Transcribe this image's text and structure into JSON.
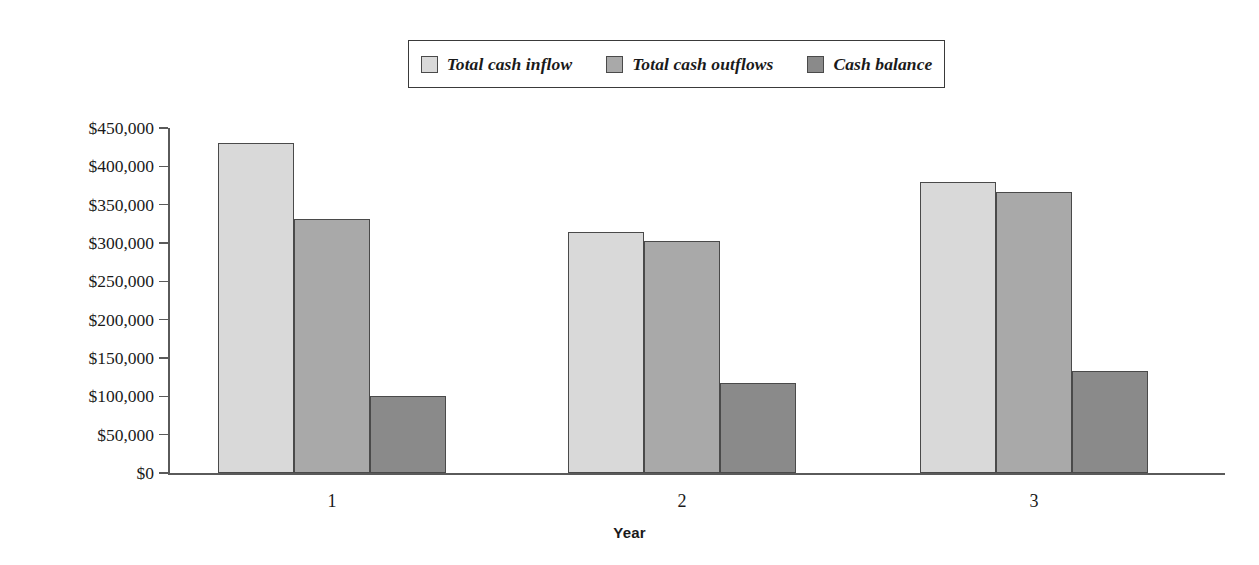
{
  "chart_data": {
    "type": "bar",
    "title": "",
    "subtitle": "",
    "xlabel": "Year",
    "ylabel": "",
    "categories": [
      "1",
      "2",
      "3"
    ],
    "series": [
      {
        "name": "Total cash inflow",
        "color": "#d9d9d9",
        "values": [
          430000,
          314000,
          380000
        ]
      },
      {
        "name": "Total cash outflows",
        "color": "#a9a9a9",
        "values": [
          331000,
          302000,
          366000
        ]
      },
      {
        "name": "Cash balance",
        "color": "#8a8a8a",
        "values": [
          101000,
          117000,
          133000
        ]
      }
    ],
    "ylim": [
      0,
      450000
    ],
    "ytick_values": [
      0,
      50000,
      100000,
      150000,
      200000,
      250000,
      300000,
      350000,
      400000,
      450000
    ],
    "ytick_labels": [
      "$0",
      "$50,000",
      "$100,000",
      "$150,000",
      "$200,000",
      "$250,000",
      "$300,000",
      "$350,000",
      "$400,000",
      "$450,000"
    ],
    "xtick_labels": [
      "1",
      "2",
      "3"
    ],
    "grid": false,
    "legend_position": "top-center",
    "legend_entries": [
      "Total cash inflow",
      "Total cash outflows",
      "Cash balance"
    ]
  },
  "legend": {
    "items": [
      {
        "label": "Total cash inflow",
        "color": "#d9d9d9"
      },
      {
        "label": "Total cash outflows",
        "color": "#a9a9a9"
      },
      {
        "label": "Cash balance",
        "color": "#8a8a8a"
      }
    ]
  },
  "axes": {
    "x_title": "Year",
    "y_labels": [
      "$450,000",
      "$400,000",
      "$350,000",
      "$300,000",
      "$250,000",
      "$200,000",
      "$150,000",
      "$100,000",
      "$50,000",
      "$0"
    ],
    "x_labels": [
      "1",
      "2",
      "3"
    ]
  }
}
